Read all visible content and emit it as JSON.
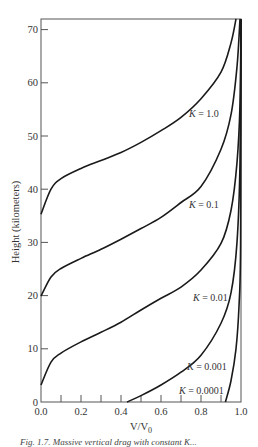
{
  "chart_data": {
    "type": "line",
    "title": "",
    "xlabel": "V/V0",
    "ylabel": "Height (kilometers)",
    "xlim": [
      0.0,
      1.0
    ],
    "ylim": [
      0,
      72
    ],
    "grid": false,
    "legend": "inline curve labels",
    "x_ticks": [
      "0.0",
      "0.2",
      "0.4",
      "0.6",
      "0.8",
      "1.0"
    ],
    "x_minor_tick_step": 0.1,
    "y_ticks": [
      "0",
      "10",
      "20",
      "30",
      "40",
      "50",
      "60",
      "70"
    ],
    "series": [
      {
        "name": "K = 1.0",
        "points": [
          [
            0.0,
            35.3
          ],
          [
            0.05,
            40.0
          ],
          [
            0.1,
            42.0
          ],
          [
            0.2,
            43.9
          ],
          [
            0.3,
            45.4
          ],
          [
            0.4,
            46.9
          ],
          [
            0.5,
            48.8
          ],
          [
            0.6,
            51.0
          ],
          [
            0.7,
            53.5
          ],
          [
            0.8,
            57.0
          ],
          [
            0.9,
            62.0
          ],
          [
            0.95,
            67.5
          ],
          [
            0.975,
            72.0
          ]
        ]
      },
      {
        "name": "K = 0.1",
        "points": [
          [
            0.0,
            19.9
          ],
          [
            0.05,
            23.5
          ],
          [
            0.1,
            25.1
          ],
          [
            0.2,
            27.0
          ],
          [
            0.3,
            28.7
          ],
          [
            0.4,
            30.6
          ],
          [
            0.5,
            32.6
          ],
          [
            0.6,
            34.7
          ],
          [
            0.7,
            37.5
          ],
          [
            0.8,
            40.5
          ],
          [
            0.9,
            47.5
          ],
          [
            0.95,
            54.0
          ],
          [
            0.98,
            63.0
          ],
          [
            0.995,
            72.0
          ]
        ]
      },
      {
        "name": "K = 0.01",
        "points": [
          [
            0.0,
            3.2
          ],
          [
            0.05,
            7.5
          ],
          [
            0.1,
            9.2
          ],
          [
            0.2,
            11.3
          ],
          [
            0.3,
            13.1
          ],
          [
            0.4,
            15.0
          ],
          [
            0.5,
            17.3
          ],
          [
            0.6,
            19.5
          ],
          [
            0.7,
            21.6
          ],
          [
            0.8,
            24.8
          ],
          [
            0.9,
            29.8
          ],
          [
            0.95,
            36.0
          ],
          [
            0.98,
            45.0
          ],
          [
            0.995,
            56.0
          ],
          [
            1.0,
            72.0
          ]
        ]
      },
      {
        "name": "K = 0.001",
        "points": [
          [
            0.43,
            0.0
          ],
          [
            0.5,
            1.2
          ],
          [
            0.6,
            3.2
          ],
          [
            0.7,
            5.6
          ],
          [
            0.8,
            8.8
          ],
          [
            0.9,
            14.8
          ],
          [
            0.95,
            20.5
          ],
          [
            0.98,
            30.0
          ],
          [
            0.995,
            45.0
          ],
          [
            1.0,
            72.0
          ]
        ]
      },
      {
        "name": "K = 0.0001",
        "points": [
          [
            0.922,
            0.0
          ],
          [
            0.95,
            4.0
          ],
          [
            0.975,
            10.0
          ],
          [
            0.99,
            18.0
          ],
          [
            0.998,
            30.0
          ],
          [
            1.0,
            72.0
          ]
        ]
      }
    ],
    "annotations": [
      {
        "text": "K = 1.0",
        "x": 0.74,
        "y": 53.5
      },
      {
        "text": "K = 0.1",
        "x": 0.74,
        "y": 36.5
      },
      {
        "text": "K = 0.01",
        "x": 0.76,
        "y": 19.0
      },
      {
        "text": "K = 0.001",
        "x": 0.73,
        "y": 6.0
      },
      {
        "text": "K = 0.0001",
        "x": 0.69,
        "y": 1.5
      }
    ]
  },
  "caption": "Fig. 1.7. Massive vertical drag with constant K..."
}
